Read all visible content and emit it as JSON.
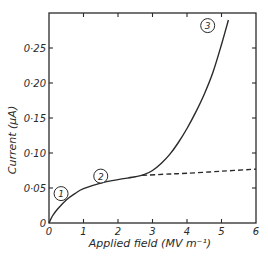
{
  "chart_data": {
    "type": "line",
    "title": "",
    "xlabel": "Applied field (MV m⁻¹)",
    "ylabel": "Current (μA)",
    "xlim": [
      0,
      6
    ],
    "ylim": [
      0,
      0.3
    ],
    "x_ticks": [
      "0",
      "1",
      "2",
      "3",
      "4",
      "5",
      "6"
    ],
    "y_ticks": [
      "0",
      "0·05",
      "0·10",
      "0·15",
      "0·20",
      "0·25"
    ],
    "y_tick_values": [
      0,
      0.05,
      0.1,
      0.15,
      0.2,
      0.25
    ],
    "grid": false,
    "legend": "none",
    "series": [
      {
        "name": "measured current",
        "style": "solid",
        "points": [
          [
            0,
            0
          ],
          [
            0.1,
            0.01
          ],
          [
            0.25,
            0.02
          ],
          [
            0.5,
            0.033
          ],
          [
            0.75,
            0.042
          ],
          [
            1.0,
            0.049
          ],
          [
            1.5,
            0.057
          ],
          [
            2.0,
            0.062
          ],
          [
            2.5,
            0.066
          ],
          [
            2.75,
            0.069
          ],
          [
            3.0,
            0.075
          ],
          [
            3.25,
            0.085
          ],
          [
            3.5,
            0.098
          ],
          [
            3.75,
            0.115
          ],
          [
            4.0,
            0.135
          ],
          [
            4.25,
            0.158
          ],
          [
            4.5,
            0.184
          ],
          [
            4.75,
            0.215
          ],
          [
            5.0,
            0.255
          ],
          [
            5.2,
            0.29
          ]
        ]
      },
      {
        "name": "extrapolated ohmic",
        "style": "dashed",
        "points": [
          [
            2.7,
            0.068
          ],
          [
            3.5,
            0.07
          ],
          [
            4.0,
            0.071
          ],
          [
            5.0,
            0.074
          ],
          [
            6.0,
            0.077
          ]
        ]
      }
    ],
    "annotations": [
      {
        "text": "1",
        "x": 0.35,
        "y": 0.042,
        "shape": "circle"
      },
      {
        "text": "2",
        "x": 1.5,
        "y": 0.067,
        "shape": "circle"
      },
      {
        "text": "3",
        "x": 4.6,
        "y": 0.282,
        "shape": "circle"
      }
    ]
  },
  "labels": {
    "x_axis_title": "Applied field (MV m⁻¹)",
    "y_axis_title": "Current (μA)",
    "region_1": "1",
    "region_2": "2",
    "region_3": "3",
    "x_origin": "0",
    "y_origin": "0"
  },
  "colors": {
    "ink": "#2a2a2a",
    "background": "#ffffff"
  }
}
